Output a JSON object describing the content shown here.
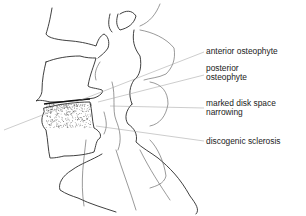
{
  "figure": {
    "labels": [
      {
        "id": "anterior-osteophyte",
        "text": "anterior osteophyte"
      },
      {
        "id": "posterior-osteophyte",
        "text": "posterior\nosteophyte"
      },
      {
        "id": "marked-disk-space-narrowing",
        "text": "marked disk space\nnarrowing"
      },
      {
        "id": "discogenic-sclerosis",
        "text": "discogenic sclerosis"
      }
    ]
  }
}
